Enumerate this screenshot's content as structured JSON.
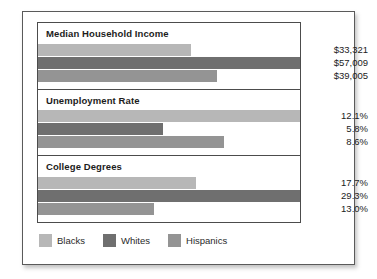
{
  "chart_data": {
    "type": "bar",
    "title": "",
    "xlabel": "",
    "ylabel": "",
    "orientation": "horizontal",
    "grid": false,
    "legend_position": "bottom-left",
    "categories": [
      "Median Household Income",
      "Unemployment Rate",
      "College Degrees"
    ],
    "series": [
      {
        "name": "Blacks",
        "color": "#b7b7b7",
        "values": [
          33321,
          12.1,
          17.7
        ],
        "labels": [
          "$33,321",
          "12.1%",
          "17.7%"
        ]
      },
      {
        "name": "Whites",
        "color": "#6f6f6f",
        "values": [
          57009,
          5.8,
          29.3
        ],
        "labels": [
          "$57,009",
          "5.8%",
          "29.3%"
        ]
      },
      {
        "name": "Hispanics",
        "color": "#949494",
        "values": [
          39005,
          8.6,
          13.0
        ],
        "labels": [
          "$39,005",
          "8.6%",
          "13.0%"
        ]
      }
    ],
    "panels": [
      {
        "title": "Median Household Income",
        "max": 57009,
        "rows": [
          {
            "series": "Blacks",
            "value": 33321,
            "label": "$33,321",
            "color": "#b7b7b7",
            "pct": 58.4
          },
          {
            "series": "Whites",
            "value": 57009,
            "label": "$57,009",
            "color": "#6f6f6f",
            "pct": 100.0
          },
          {
            "series": "Hispanics",
            "value": 39005,
            "label": "$39,005",
            "color": "#949494",
            "pct": 68.4
          }
        ]
      },
      {
        "title": "Unemployment Rate",
        "max": 12.1,
        "rows": [
          {
            "series": "Blacks",
            "value": 12.1,
            "label": "12.1%",
            "color": "#b7b7b7",
            "pct": 100.0
          },
          {
            "series": "Whites",
            "value": 5.8,
            "label": "5.8%",
            "color": "#6f6f6f",
            "pct": 47.9
          },
          {
            "series": "Hispanics",
            "value": 8.6,
            "label": "8.6%",
            "color": "#949494",
            "pct": 71.1
          }
        ]
      },
      {
        "title": "College Degrees",
        "max": 29.3,
        "rows": [
          {
            "series": "Blacks",
            "value": 17.7,
            "label": "17.7%",
            "color": "#b7b7b7",
            "pct": 60.4
          },
          {
            "series": "Whites",
            "value": 29.3,
            "label": "29.3%",
            "color": "#6f6f6f",
            "pct": 100.0
          },
          {
            "series": "Hispanics",
            "value": 13.0,
            "label": "13.0%",
            "color": "#949494",
            "pct": 44.4
          }
        ]
      }
    ],
    "legend": [
      {
        "label": "Blacks",
        "color": "#b7b7b7"
      },
      {
        "label": "Whites",
        "color": "#6f6f6f"
      },
      {
        "label": "Hispanics",
        "color": "#949494"
      }
    ]
  }
}
